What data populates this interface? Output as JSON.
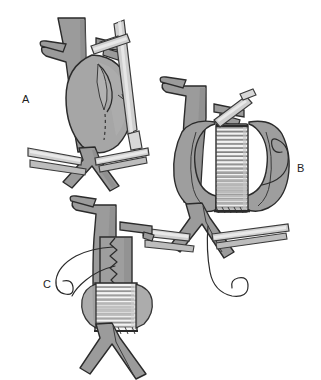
{
  "figure": {
    "background_color": "#ffffff",
    "width": 321,
    "height": 380,
    "style": "grayscale line drawing with flat gray fills"
  },
  "palette": {
    "outline": "#2b2b2b",
    "vessel_fill": "#9b9b9b",
    "vessel_shadow": "#808080",
    "vessel_highlight": "#b4b4b4",
    "aneurysm_fill": "#a6a6a6",
    "sac_flap_fill": "#9e9e9e",
    "graft_fill": "#f2f2f2",
    "graft_rib": "#5a5a5a",
    "clamp_fill": "#cfcfcf",
    "clamp_edge": "#3a3a3a",
    "suture_thread": "#2b2b2b",
    "label_text": "#1c1c1c"
  },
  "panels": [
    {
      "id": "A",
      "label": "A",
      "label_position": {
        "x": 22,
        "y": 103
      },
      "caption": "Aneurysm sac exposed and opened; aorta clamped proximally and distally",
      "elements": [
        "proximal-aorta",
        "renal-artery-stub",
        "aneurysm-sac",
        "incision-line",
        "cutting-instrument",
        "proximal-clamp",
        "left-iliac-clamp",
        "right-iliac-clamp",
        "iliac-bifurcation"
      ]
    },
    {
      "id": "B",
      "label": "B",
      "label_position": {
        "x": 297,
        "y": 172
      },
      "caption": "Tube graft sewn in place within the opened aneurysm sac",
      "elements": [
        "proximal-aorta",
        "opened-sac-flap-left",
        "opened-sac-flap-right",
        "tube-graft",
        "graft-corrugations",
        "proximal-anastomosis-suture",
        "distal-anastomosis-suture",
        "suture-thread-loop",
        "proximal-clamp",
        "iliac-clamps",
        "trailing-suture"
      ]
    },
    {
      "id": "C",
      "label": "C",
      "label_position": {
        "x": 43,
        "y": 288
      },
      "caption": "Aneurysm sac closed over the graft; distal graft still exposed",
      "elements": [
        "proximal-aorta",
        "closed-sac-over-graft",
        "running-closure-suture",
        "exposed-distal-graft",
        "graft-corrugations",
        "distal-anastomosis-suture",
        "suture-needle-thread",
        "iliac-bifurcation"
      ]
    }
  ]
}
